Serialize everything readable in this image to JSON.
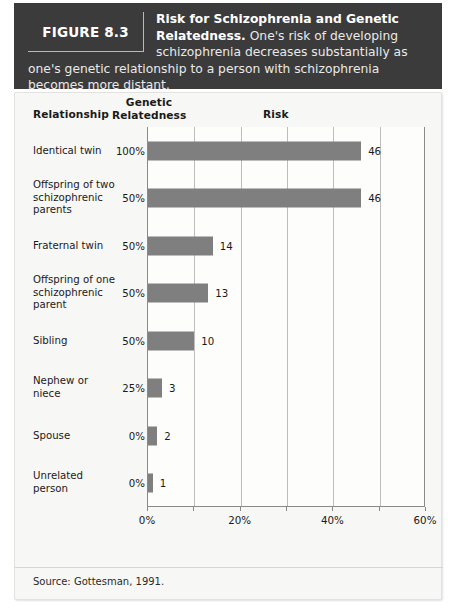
{
  "figure": {
    "badge": "FIGURE 8.3",
    "caption_title": "Risk for Schizophrenia and Genetic Relatedness.",
    "caption_body": " One's risk of developing schizophrenia decreases substantially as one's genetic relationship to a person with schizophrenia becomes more distant."
  },
  "columns": {
    "relationship": "Relationship",
    "genetic_relatedness_line1": "Genetic",
    "genetic_relatedness_line2": "Relatedness",
    "risk": "Risk"
  },
  "source": "Source: Gottesman, 1991.",
  "colors": {
    "header_bg": "#3b3b3b",
    "panel_bg": "#f7f7f5",
    "bar": "#7f7f7f",
    "axis": "#8a8a8a",
    "gridline": "#bdbdbd"
  },
  "chart_data": {
    "type": "bar",
    "orientation": "horizontal",
    "title": "Risk for Schizophrenia and Genetic Relatedness",
    "xlabel": "Risk",
    "ylabel": "Relationship",
    "xlim": [
      0,
      60
    ],
    "x_tick_values": [
      0,
      10,
      20,
      30,
      40,
      50,
      60
    ],
    "x_tick_labels": [
      "0%",
      "20%",
      "40%",
      "60%"
    ],
    "labeled_ticks": [
      0,
      20,
      40,
      60
    ],
    "grid": true,
    "grid_axis": "x",
    "legend": false,
    "value_labels": true,
    "categories": [
      "Identical twin",
      "Offspring of two schizophrenic parents",
      "Fraternal twin",
      "Offspring of one schizophrenic parent",
      "Sibling",
      "Nephew or niece",
      "Spouse",
      "Unrelated person"
    ],
    "genetic_relatedness": [
      "100%",
      "50%",
      "50%",
      "50%",
      "50%",
      "25%",
      "0%",
      "0%"
    ],
    "values": [
      46,
      46,
      14,
      13,
      10,
      3,
      2,
      1
    ],
    "value_label_text": [
      "46",
      "46",
      "14",
      "13",
      "10",
      "3",
      "2",
      "1"
    ],
    "rows": [
      {
        "label": "Identical twin",
        "relatedness": "100%",
        "value": 46,
        "value_text": "46"
      },
      {
        "label": "Offspring of two schizophrenic parents",
        "relatedness": "50%",
        "value": 46,
        "value_text": "46"
      },
      {
        "label": "Fraternal twin",
        "relatedness": "50%",
        "value": 14,
        "value_text": "14"
      },
      {
        "label": "Offspring of one schizophrenic parent",
        "relatedness": "50%",
        "value": 13,
        "value_text": "13"
      },
      {
        "label": "Sibling",
        "relatedness": "50%",
        "value": 10,
        "value_text": "10"
      },
      {
        "label": "Nephew or niece",
        "relatedness": "25%",
        "value": 3,
        "value_text": "3"
      },
      {
        "label": "Spouse",
        "relatedness": "0%",
        "value": 2,
        "value_text": "2"
      },
      {
        "label": "Unrelated person",
        "relatedness": "0%",
        "value": 1,
        "value_text": "1"
      }
    ]
  }
}
